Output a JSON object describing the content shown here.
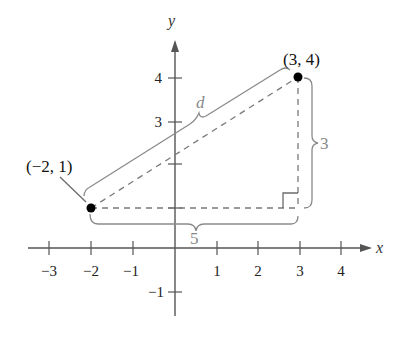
{
  "figure": {
    "x_axis_label": "x",
    "y_axis_label": "y",
    "x_ticks": [
      {
        "value": "−3",
        "px": 49
      },
      {
        "value": "−2",
        "px": 91
      },
      {
        "value": "−1",
        "px": 133
      },
      {
        "value": "1",
        "px": 217
      },
      {
        "value": "2",
        "px": 258
      },
      {
        "value": "3",
        "px": 300
      },
      {
        "value": "4",
        "px": 341
      }
    ],
    "y_ticks": [
      {
        "value": "4",
        "py": 78
      },
      {
        "value": "3",
        "py": 122
      },
      {
        "value": "−1",
        "py": 292
      }
    ],
    "points": [
      {
        "label": "(−2, 1)",
        "x": -2,
        "y": 1
      },
      {
        "label": "(3, 4)",
        "x": 3,
        "y": 4
      }
    ],
    "hypotenuse_label": "d",
    "horizontal_leg_label": "5",
    "vertical_leg_label": "3",
    "right_angle_marker": true,
    "colors": {
      "axis": "#555555",
      "point": "#000000",
      "brace": "#8a8a8a",
      "dashed": "#7a7a7a"
    }
  }
}
